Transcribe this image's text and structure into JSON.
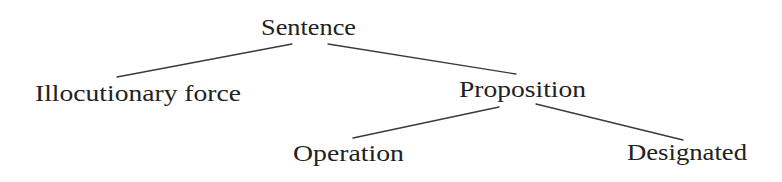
{
  "diagram": {
    "type": "tree",
    "nodes": {
      "sentence": {
        "label": "Sentence"
      },
      "illocutionary_force": {
        "label": "Illocutionary force"
      },
      "proposition": {
        "label": "Proposition"
      },
      "operation": {
        "label": "Operation"
      },
      "designated": {
        "label": "Designated"
      }
    },
    "edges": [
      {
        "from": "Sentence",
        "to": "Illocutionary force"
      },
      {
        "from": "Sentence",
        "to": "Proposition"
      },
      {
        "from": "Proposition",
        "to": "Operation"
      },
      {
        "from": "Proposition",
        "to": "Designated"
      }
    ],
    "colors": {
      "text": "#222222",
      "line": "#3a3a3a",
      "background": "#ffffff"
    }
  }
}
